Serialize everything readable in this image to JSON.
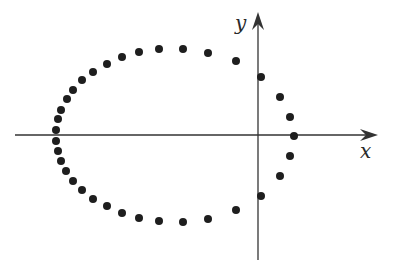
{
  "diagram": {
    "type": "scatter-plot-of-points-on-closed-curve",
    "axes": {
      "x_label": "x",
      "y_label": "y",
      "origin_px": [
        258,
        135
      ],
      "x_axis_px": {
        "from": 15,
        "to": 378
      },
      "y_axis_px": {
        "from": 260,
        "to": 12
      },
      "color": "#333333"
    },
    "point_color": "#1e1e1e",
    "point_radius_px": 4,
    "points_px": [
      [
        294,
        136
      ],
      [
        290,
        117
      ],
      [
        280,
        97
      ],
      [
        261,
        77
      ],
      [
        236,
        61
      ],
      [
        208,
        53
      ],
      [
        183,
        49
      ],
      [
        159,
        49
      ],
      [
        139,
        52
      ],
      [
        122,
        57
      ],
      [
        107,
        64
      ],
      [
        93,
        72
      ],
      [
        82,
        80
      ],
      [
        73,
        90
      ],
      [
        67,
        99
      ],
      [
        61,
        110
      ],
      [
        58,
        119
      ],
      [
        56,
        130
      ],
      [
        56,
        141
      ],
      [
        58,
        151
      ],
      [
        61,
        161
      ],
      [
        66,
        171
      ],
      [
        73,
        181
      ],
      [
        82,
        190
      ],
      [
        93,
        199
      ],
      [
        107,
        206
      ],
      [
        122,
        213
      ],
      [
        139,
        218
      ],
      [
        159,
        221
      ],
      [
        183,
        222
      ],
      [
        208,
        219
      ],
      [
        236,
        210
      ],
      [
        261,
        196
      ],
      [
        280,
        176
      ],
      [
        290,
        156
      ]
    ]
  }
}
